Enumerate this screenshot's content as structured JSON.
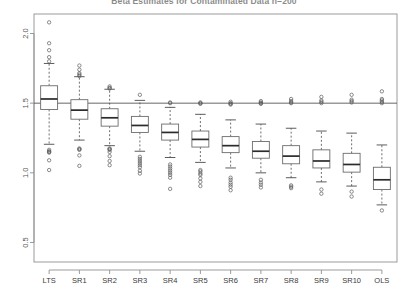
{
  "chart": {
    "title": "Beta Estimates for Contaminated Data n=200",
    "ylabel": "",
    "xlabel": ""
  },
  "chart_data": {
    "type": "boxplot",
    "title": "Beta Estimates for Contaminated Data n=200",
    "xlabel": "",
    "ylabel": "",
    "ylim": [
      0.36,
      2.14
    ],
    "yticks": [
      0.5,
      1.0,
      1.5,
      2.0
    ],
    "ytick_labels": [
      "0.5",
      "1.0",
      "1.5",
      "2.0"
    ],
    "grid": false,
    "legend": "none",
    "reference_line": {
      "y": 1.5,
      "orientation": "horizontal",
      "color": "#555555"
    },
    "categories": [
      "LTS",
      "SR1",
      "SR2",
      "SR3",
      "SR4",
      "SR5",
      "SR6",
      "SR7",
      "SR8",
      "SR9",
      "SR10",
      "OLS"
    ],
    "boxes": [
      {
        "label": "LTS",
        "lower_whisker": 1.205,
        "q1": 1.455,
        "median": 1.53,
        "q3": 1.625,
        "upper_whisker": 1.785,
        "outliers": [
          2.08,
          1.93,
          1.88,
          1.83,
          1.8,
          1.165,
          1.155,
          1.15,
          1.145,
          1.09,
          1.02
        ]
      },
      {
        "label": "SR1",
        "lower_whisker": 1.235,
        "q1": 1.385,
        "median": 1.45,
        "q3": 1.525,
        "upper_whisker": 1.69,
        "outliers": [
          1.77,
          1.74,
          1.715,
          1.705,
          1.695,
          1.175,
          1.17,
          1.165,
          1.125,
          1.05
        ]
      },
      {
        "label": "SR2",
        "lower_whisker": 1.195,
        "q1": 1.335,
        "median": 1.395,
        "q3": 1.46,
        "upper_whisker": 1.6,
        "outliers": [
          1.62,
          1.61,
          1.605,
          1.175,
          1.17,
          1.165,
          1.15,
          1.12,
          1.085,
          1.055
        ]
      },
      {
        "label": "SR3",
        "lower_whisker": 1.155,
        "q1": 1.29,
        "median": 1.34,
        "q3": 1.405,
        "upper_whisker": 1.52,
        "outliers": [
          1.56,
          1.115,
          1.1,
          1.085,
          1.07,
          1.055,
          1.04,
          1.015,
          0.995
        ]
      },
      {
        "label": "SR4",
        "lower_whisker": 1.11,
        "q1": 1.235,
        "median": 1.29,
        "q3": 1.35,
        "upper_whisker": 1.47,
        "outliers": [
          1.505,
          1.5,
          1.06,
          1.045,
          1.03,
          1.015,
          1.0,
          0.985,
          0.965,
          0.885
        ]
      },
      {
        "label": "SR5",
        "lower_whisker": 1.075,
        "q1": 1.185,
        "median": 1.24,
        "q3": 1.3,
        "upper_whisker": 1.42,
        "outliers": [
          1.505,
          1.5,
          1.495,
          1.02,
          1.01,
          0.995,
          0.985,
          0.96,
          0.935,
          0.905
        ]
      },
      {
        "label": "SR6",
        "lower_whisker": 1.035,
        "q1": 1.145,
        "median": 1.195,
        "q3": 1.26,
        "upper_whisker": 1.38,
        "outliers": [
          1.51,
          1.5,
          1.495,
          1.49,
          0.965,
          0.95,
          0.93,
          0.915,
          0.9,
          0.875
        ]
      },
      {
        "label": "SR7",
        "lower_whisker": 1.0,
        "q1": 1.105,
        "median": 1.155,
        "q3": 1.225,
        "upper_whisker": 1.35,
        "outliers": [
          1.515,
          1.505,
          1.5,
          1.495,
          0.95,
          0.93,
          0.915,
          0.895
        ]
      },
      {
        "label": "SR8",
        "lower_whisker": 0.965,
        "q1": 1.065,
        "median": 1.12,
        "q3": 1.195,
        "upper_whisker": 1.32,
        "outliers": [
          1.53,
          1.515,
          1.505,
          1.5,
          0.91,
          0.9,
          0.89
        ]
      },
      {
        "label": "SR9",
        "lower_whisker": 0.935,
        "q1": 1.035,
        "median": 1.085,
        "q3": 1.165,
        "upper_whisker": 1.3,
        "outliers": [
          1.545,
          1.52,
          1.51,
          1.5,
          0.88,
          0.85
        ]
      },
      {
        "label": "SR10",
        "lower_whisker": 0.905,
        "q1": 1.005,
        "median": 1.06,
        "q3": 1.14,
        "upper_whisker": 1.285,
        "outliers": [
          1.56,
          1.525,
          1.515,
          1.505,
          0.865,
          0.83
        ]
      },
      {
        "label": "OLS",
        "lower_whisker": 0.77,
        "q1": 0.88,
        "median": 0.95,
        "q3": 1.04,
        "upper_whisker": 1.2,
        "outliers": [
          1.585,
          1.53,
          1.52,
          1.51,
          1.5,
          0.73
        ]
      }
    ]
  }
}
